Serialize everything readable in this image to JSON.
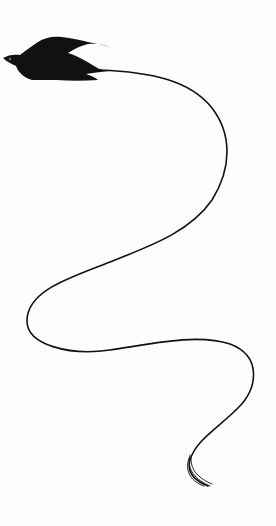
{
  "illustration": {
    "subject": "bird-silhouette-with-trailing-line",
    "colors": {
      "background": "#fdfdfd",
      "ink": "#111111"
    }
  }
}
